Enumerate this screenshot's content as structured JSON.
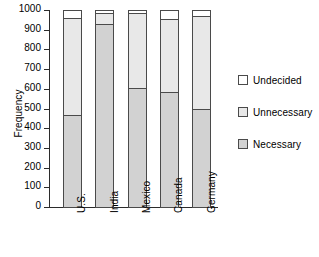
{
  "chart_data": {
    "type": "bar",
    "subtype": "stacked-vertical",
    "title": "",
    "xlabel": "",
    "ylabel": "Frequency",
    "ylim": [
      0,
      1000
    ],
    "yticks": [
      0,
      100,
      200,
      300,
      400,
      500,
      600,
      700,
      800,
      900,
      1000
    ],
    "grid": false,
    "legend_position": "right",
    "categories": [
      "U.S.",
      "India",
      "Mexico",
      "Canada",
      "Germany"
    ],
    "series": [
      {
        "name": "Necessary",
        "color": "#d2d2d2",
        "values": [
          465,
          930,
          605,
          585,
          495
        ]
      },
      {
        "name": "Unnecessary",
        "color": "#e8e8e8",
        "values": [
          495,
          55,
          380,
          370,
          475
        ]
      },
      {
        "name": "Undecided",
        "color": "#ffffff",
        "values": [
          40,
          15,
          15,
          45,
          30
        ]
      }
    ],
    "cumulative_tops": {
      "Necessary": [
        465,
        930,
        605,
        585,
        495
      ],
      "Unnecessary": [
        960,
        985,
        985,
        955,
        970
      ],
      "Undecided": [
        1000,
        1000,
        1000,
        1000,
        1000
      ]
    },
    "totals": [
      1000,
      1000,
      1000,
      1000,
      1000
    ]
  },
  "axis": {
    "y_title": "Frequency",
    "y_ticks": [
      "1000",
      "900",
      "800",
      "700",
      "600",
      "500",
      "400",
      "300",
      "200",
      "100",
      "0"
    ],
    "x_ticks": [
      "U.S.",
      "India",
      "Mexico",
      "Canada",
      "Germany"
    ]
  },
  "legend": {
    "items": [
      {
        "label": "Undecided"
      },
      {
        "label": "Unnecessary"
      },
      {
        "label": "Necessary"
      }
    ]
  }
}
